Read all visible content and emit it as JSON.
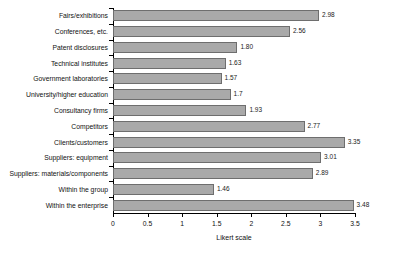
{
  "chart_data": {
    "type": "bar",
    "orientation": "horizontal",
    "title": "",
    "xlabel": "Likert scale",
    "ylabel": "",
    "xlim": [
      0,
      3.5
    ],
    "xticks": [
      "0",
      "0.5",
      "1",
      "1.5",
      "2",
      "2.5",
      "3",
      "3.5"
    ],
    "xtick_values": [
      0,
      0.5,
      1,
      1.5,
      2,
      2.5,
      3,
      3.5
    ],
    "grid": false,
    "legend": false,
    "bar_color": "#a9a9a9",
    "bar_border_color": "#6e6e6e",
    "categories": [
      "Fairs/exhibitions",
      "Conferences, etc.",
      "Patent disclosures",
      "Technical institutes",
      "Government laboratories",
      "University/higher education",
      "Consultancy firms",
      "Competitors",
      "Clients/customers",
      "Suppliers: equipment",
      "Suppliers: materials/components",
      "Within the group",
      "Within the enterprise"
    ],
    "values": [
      2.98,
      2.56,
      1.8,
      1.63,
      1.57,
      1.7,
      1.93,
      2.77,
      3.35,
      3.01,
      2.89,
      1.46,
      3.48
    ],
    "value_labels": [
      "2.98",
      "2.56",
      "1.80",
      "1.63",
      "1.57",
      "1.7",
      "1.93",
      "2.77",
      "3.35",
      "3.01",
      "2.89",
      "1.46",
      "3.48"
    ]
  }
}
